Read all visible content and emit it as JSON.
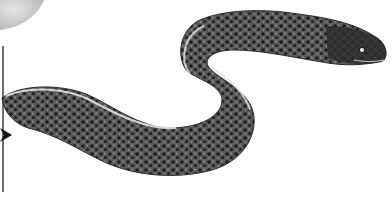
{
  "scene": {
    "subject": "moray eel illustration",
    "colors": {
      "background": "#ffffff",
      "body_dark": "#2a2a2a",
      "body_mid": "#6e6e6e",
      "body_light": "#b9b9b9",
      "belly_edge": "#e4e4e4",
      "circle_fill": "#cfcfcf",
      "marker_line": "#111111"
    },
    "elements": [
      "grey-circle-top-left",
      "vertical-line-left",
      "arrowhead-left",
      "eel-body",
      "eel-head",
      "eel-eye"
    ]
  }
}
